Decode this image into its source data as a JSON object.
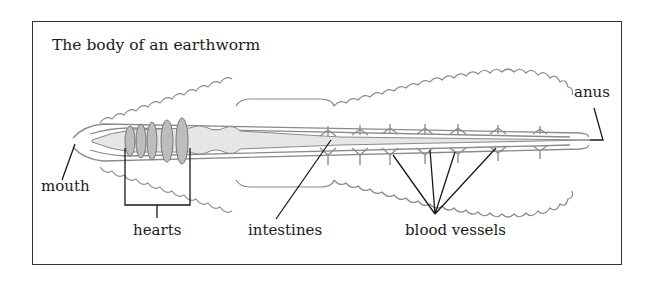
{
  "title": "The body of an earthworm",
  "labels": {
    "mouth": "mouth",
    "hearts": "hearts",
    "intestines": "intestines",
    "blood_vessels": "blood vessels",
    "anus": "anus"
  },
  "colors": {
    "outline": "#8a8a8a",
    "intestine_fill": "#e6e6e6",
    "heart_fill": "#bdbdbd",
    "vessel": "#8f8f8f",
    "leader_line": "#1a1a1a",
    "frame": "#333333"
  },
  "counts": {
    "hearts": 5,
    "vessel_branches": 7
  }
}
